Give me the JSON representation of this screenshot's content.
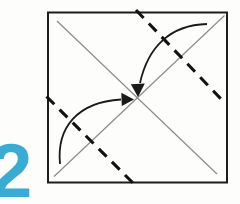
{
  "step": {
    "number": "2"
  },
  "colors": {
    "background": "#fdfdfc",
    "step_number": "#3aabd2",
    "paper_outline": "#1d1d1b",
    "crease": "#8c8c8c",
    "fold_line": "#121212",
    "arrow": "#1a1a1a"
  }
}
